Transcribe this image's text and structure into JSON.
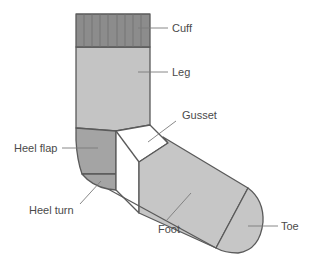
{
  "diagram": {
    "colors": {
      "cuff": "#8c8c8c",
      "leg": "#c4c4c4",
      "heel_flap": "#a4a4a4",
      "heel_turn": "#a4a4a4",
      "gusset": "#ffffff",
      "foot": "#c6c6c6",
      "toe": "#c6c6c6",
      "outline": "#5a5a5a",
      "label_text": "#4a4a4a",
      "background": "#ffffff"
    },
    "parts": [
      {
        "id": "cuff",
        "label": "Cuff"
      },
      {
        "id": "leg",
        "label": "Leg"
      },
      {
        "id": "gusset",
        "label": "Gusset"
      },
      {
        "id": "heel_flap",
        "label": "Heel flap"
      },
      {
        "id": "heel_turn",
        "label": "Heel turn"
      },
      {
        "id": "foot",
        "label": "Foot"
      },
      {
        "id": "toe",
        "label": "Toe"
      }
    ]
  }
}
